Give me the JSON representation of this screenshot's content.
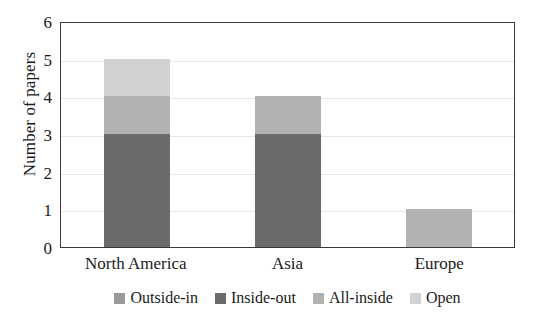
{
  "chart_data": {
    "type": "bar",
    "subtype": "stacked-vertical",
    "title": "",
    "xlabel": "",
    "ylabel": "Number of papers",
    "categories": [
      "North America",
      "Asia",
      "Europe"
    ],
    "series": [
      {
        "name": "Outside-in",
        "color": "#9a9a9a",
        "values": [
          0,
          0,
          0
        ]
      },
      {
        "name": "Inside-out",
        "color": "#6b6b6b",
        "values": [
          3,
          3,
          0
        ]
      },
      {
        "name": "All-inside",
        "color": "#b2b2b2",
        "values": [
          1,
          1,
          1
        ]
      },
      {
        "name": "Open",
        "color": "#d2d2d2",
        "values": [
          1,
          0,
          0
        ]
      }
    ],
    "totals": [
      5,
      4,
      1
    ],
    "ylim": [
      0,
      6
    ],
    "yticks": [
      0,
      1,
      2,
      3,
      4,
      5,
      6
    ],
    "ytick_labels": [
      "0",
      "1",
      "2",
      "3",
      "4",
      "5",
      "6"
    ],
    "grid": true,
    "legend_position": "bottom"
  },
  "axis": {
    "y_title": "Number of papers",
    "y_tick_labels": [
      "6",
      "5",
      "4",
      "3",
      "2",
      "1",
      "0"
    ],
    "x_tick_labels": [
      "North America",
      "Asia",
      "Europe"
    ]
  },
  "legend": {
    "items": [
      {
        "label": "Outside-in"
      },
      {
        "label": "Inside-out"
      },
      {
        "label": "All-inside"
      },
      {
        "label": "Open"
      }
    ]
  }
}
